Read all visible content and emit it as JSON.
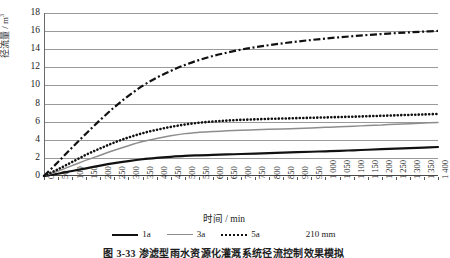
{
  "figure": {
    "caption": "图 3-33  渗滤型雨水资源化灌溉系统径流控制效果模拟",
    "ylabel_text": "径流量 / m",
    "ylabel_exponent": "3",
    "xlabel": "时间 / min"
  },
  "legend": {
    "items": [
      {
        "label": "1a",
        "style": "solid-black",
        "color": "#111111"
      },
      {
        "label": "3a",
        "style": "solid-gray",
        "color": "#8d8d8d"
      },
      {
        "label": "5a",
        "style": "dotted",
        "color": "#111111"
      },
      {
        "label": "210 mm",
        "style": "dash-dot",
        "color": "#111111"
      }
    ]
  },
  "chart_data": {
    "type": "line",
    "title": "",
    "xlabel": "时间 / min",
    "ylabel": "径流量 / m³",
    "xlim": [
      0,
      1400
    ],
    "ylim": [
      0,
      18
    ],
    "ytick_values": [
      0,
      2,
      4,
      6,
      8,
      10,
      12,
      14,
      16,
      18
    ],
    "ytick_labels": [
      "0",
      "2",
      "4",
      "6",
      "8",
      "10",
      "12",
      "14",
      "16",
      "18"
    ],
    "xtick_values": [
      0,
      50,
      100,
      150,
      200,
      250,
      300,
      350,
      400,
      450,
      500,
      550,
      600,
      650,
      700,
      750,
      800,
      850,
      900,
      950,
      1000,
      1050,
      1100,
      1150,
      1200,
      1250,
      1300,
      1350,
      1400
    ],
    "xtick_labels": [
      "0",
      "50",
      "100",
      "150",
      "200",
      "250",
      "300",
      "350",
      "400",
      "450",
      "500",
      "550",
      "600",
      "650",
      "700",
      "750",
      "800",
      "850",
      "900",
      "950",
      "1 000",
      "1 050",
      "1 100",
      "1 150",
      "1 200",
      "1 250",
      "1 300",
      "1 350",
      "1 400"
    ],
    "grid": true,
    "grid_axis": "y",
    "legend_position": "bottom",
    "x": [
      0,
      50,
      100,
      150,
      200,
      250,
      300,
      350,
      400,
      450,
      500,
      550,
      600,
      650,
      700,
      750,
      800,
      850,
      900,
      950,
      1000,
      1050,
      1100,
      1150,
      1200,
      1250,
      1300,
      1350,
      1400
    ],
    "series": [
      {
        "name": "1a",
        "style": "solid-black",
        "color": "#111111",
        "values": [
          0,
          0.25,
          0.55,
          0.85,
          1.15,
          1.42,
          1.65,
          1.85,
          2.0,
          2.12,
          2.22,
          2.28,
          2.33,
          2.38,
          2.43,
          2.48,
          2.53,
          2.58,
          2.63,
          2.68,
          2.73,
          2.78,
          2.84,
          2.9,
          2.96,
          3.02,
          3.08,
          3.14,
          3.2
        ]
      },
      {
        "name": "3a",
        "style": "solid-gray",
        "color": "#8d8d8d",
        "values": [
          0,
          0.55,
          1.15,
          1.75,
          2.3,
          2.85,
          3.35,
          3.8,
          4.15,
          4.45,
          4.68,
          4.82,
          4.92,
          4.99,
          5.05,
          5.1,
          5.15,
          5.2,
          5.25,
          5.31,
          5.37,
          5.43,
          5.5,
          5.57,
          5.64,
          5.71,
          5.78,
          5.85,
          5.92
        ]
      },
      {
        "name": "5a",
        "style": "dotted",
        "color": "#111111",
        "values": [
          0,
          0.75,
          1.55,
          2.35,
          3.05,
          3.7,
          4.25,
          4.72,
          5.1,
          5.42,
          5.68,
          5.88,
          6.02,
          6.12,
          6.2,
          6.26,
          6.31,
          6.35,
          6.39,
          6.43,
          6.47,
          6.51,
          6.55,
          6.6,
          6.65,
          6.7,
          6.75,
          6.8,
          6.85
        ]
      },
      {
        "name": "210 mm",
        "style": "dash-dot",
        "color": "#111111",
        "values": [
          0,
          1.55,
          3.15,
          4.7,
          6.2,
          7.6,
          8.85,
          9.95,
          10.85,
          11.6,
          12.25,
          12.8,
          13.25,
          13.62,
          13.95,
          14.22,
          14.45,
          14.66,
          14.85,
          15.02,
          15.18,
          15.32,
          15.45,
          15.57,
          15.68,
          15.78,
          15.87,
          15.95,
          16.02
        ]
      }
    ]
  }
}
